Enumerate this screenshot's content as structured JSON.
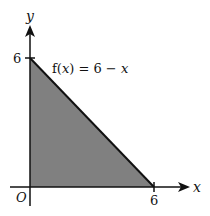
{
  "diagram": {
    "function_label": "f(x) = 6 − x",
    "function_label_parts": {
      "f": "f(",
      "x1": "x",
      "rest": ") = 6 − ",
      "x2": "x"
    },
    "x_axis_label": "x",
    "y_axis_label": "y",
    "origin_label": "O",
    "x_intercept_label": "6",
    "y_intercept_label": "6",
    "shaded_region": "triangle bounded by axes and line y = 6 − x",
    "fill_color": "#808080",
    "stroke_color": "#111111"
  }
}
